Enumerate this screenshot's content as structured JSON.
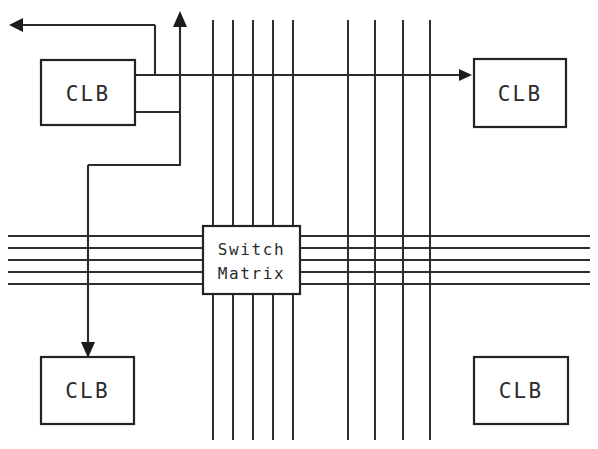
{
  "diagram": {
    "background_color": "#ffffff",
    "line_color": "#2a2a2a",
    "text_color": "#2b2b2b",
    "width": 598,
    "height": 449
  },
  "blocks": {
    "clb_top_left": {
      "label": "CLB",
      "x": 41,
      "y": 60,
      "width": 94,
      "height": 65
    },
    "clb_top_right": {
      "label": "CLB",
      "x": 474,
      "y": 59,
      "width": 92,
      "height": 68
    },
    "clb_bottom_left": {
      "label": "CLB",
      "x": 41,
      "y": 357,
      "width": 93,
      "height": 67
    },
    "clb_bottom_right": {
      "label": "CLB",
      "x": 474,
      "y": 357,
      "width": 94,
      "height": 67
    },
    "switch_matrix": {
      "label_line_1": "Switch",
      "label_line_2": "Matrix",
      "x": 203,
      "y": 226,
      "width": 97,
      "height": 68
    }
  },
  "routing": {
    "vertical_channel_left_x": [
      213,
      233,
      253,
      273,
      293
    ],
    "vertical_channel_right_x": [
      348,
      375,
      403,
      430
    ],
    "horizontal_channel_y": [
      236,
      248,
      260,
      272,
      284
    ],
    "vertical_extent_top": 20,
    "vertical_extent_bottom": 440,
    "horizontal_extent_left": 8,
    "horizontal_extent_right": 590
  },
  "nets": {
    "clb_output_upper_y": 75,
    "clb_output_lower_y": 112,
    "clb_right_edge_x": 135,
    "feedback_riser_x": 155,
    "feedback_top_y": 25,
    "feedback_arrow_tip_x": 10,
    "up_arrow_x": 180,
    "up_arrow_tip_y": 12,
    "lower_net_corner_x": 180,
    "lower_net_corner_y": 165,
    "down_riser_x": 88,
    "down_arrow_tip_y": 356,
    "right_arrow_tip_x": 472,
    "right_arrow_y": 75
  },
  "icons": {
    "arrow_left": "arrow-left-icon",
    "arrow_up": "arrow-up-icon",
    "arrow_down": "arrow-down-icon",
    "arrow_right": "arrow-right-icon"
  }
}
